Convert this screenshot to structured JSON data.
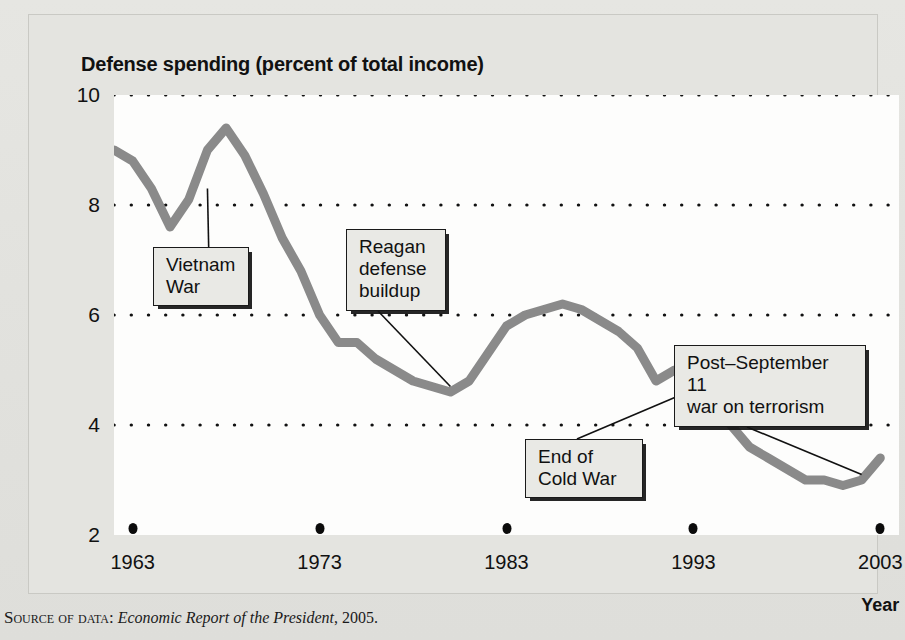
{
  "figure": {
    "title": "Defense spending (percent of total income)",
    "source_prefix": "Source of data:",
    "source_work": "Economic Report of the President",
    "source_year": ", 2005."
  },
  "chart_data": {
    "type": "line",
    "title": "Defense spending (percent of total income)",
    "xlabel": "Year",
    "ylabel": "",
    "xlim": [
      1962,
      2004
    ],
    "ylim": [
      2,
      10
    ],
    "grid": true,
    "gridlines": [
      10,
      8,
      6,
      4
    ],
    "legend": "none",
    "line_color": "#8a8a8a",
    "ytick_labels": [
      "10",
      "8",
      "6",
      "4",
      "2"
    ],
    "ytick_values": [
      10,
      8,
      6,
      4,
      2
    ],
    "xtick_labels": [
      "1963",
      "1973",
      "1983",
      "1993",
      "2003"
    ],
    "xtick_values": [
      1963,
      1973,
      1983,
      1993,
      2003
    ],
    "x": [
      1962,
      1963,
      1964,
      1965,
      1966,
      1967,
      1968,
      1969,
      1970,
      1971,
      1972,
      1973,
      1974,
      1975,
      1976,
      1977,
      1978,
      1979,
      1980,
      1981,
      1982,
      1983,
      1984,
      1985,
      1986,
      1987,
      1988,
      1989,
      1990,
      1991,
      1992,
      1993,
      1994,
      1995,
      1996,
      1997,
      1998,
      1999,
      2000,
      2001,
      2002,
      2003
    ],
    "values": [
      9.0,
      8.8,
      8.3,
      7.6,
      8.1,
      9.0,
      9.4,
      8.9,
      8.2,
      7.4,
      6.8,
      6.0,
      5.5,
      5.5,
      5.2,
      5.0,
      4.8,
      4.7,
      4.6,
      4.8,
      5.3,
      5.8,
      6.0,
      6.1,
      6.2,
      6.1,
      5.9,
      5.7,
      5.4,
      4.8,
      5.0,
      4.7,
      4.3,
      4.0,
      3.6,
      3.4,
      3.2,
      3.0,
      3.0,
      2.9,
      3.0,
      3.4
    ],
    "annotations": [
      {
        "id": "vietnam-war",
        "label": "Vietnam\nWar",
        "point_year": 1967,
        "point_value": 8.3
      },
      {
        "id": "reagan-buildup",
        "label": "Reagan\ndefense\nbuildup",
        "point_year": 1980,
        "point_value": 4.7
      },
      {
        "id": "end-cold-war",
        "label": "End of\nCold War",
        "point_year": 1992,
        "point_value": 4.5
      },
      {
        "id": "post-sept-11",
        "label": "Post–September 11\nwar on terrorism",
        "point_year": 2002,
        "point_value": 3.1
      }
    ]
  }
}
